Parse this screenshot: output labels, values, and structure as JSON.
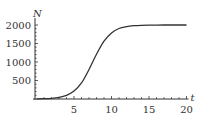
{
  "chart_data": {
    "type": "line",
    "title": "",
    "xlabel": "t",
    "ylabel": "N",
    "xlim": [
      0,
      20
    ],
    "ylim": [
      0,
      2100
    ],
    "grid": false,
    "legend": null,
    "x_ticks": [
      5,
      10,
      15,
      20
    ],
    "y_ticks": [
      500,
      1000,
      1500,
      2000
    ],
    "x_minor_tick_step": 1,
    "series": [
      {
        "name": "N(t) logistic growth",
        "color": "#333333",
        "x": [
          0,
          1,
          2,
          3,
          4,
          5,
          6,
          7,
          8,
          9,
          10,
          11,
          12,
          13,
          14,
          15,
          16,
          17,
          18,
          19,
          20
        ],
        "y": [
          3,
          8,
          18,
          43,
          100,
          214,
          433,
          796,
          1210,
          1564,
          1786,
          1905,
          1956,
          1981,
          1992,
          1997,
          1999,
          2000,
          2000,
          2000,
          2000
        ]
      }
    ]
  }
}
